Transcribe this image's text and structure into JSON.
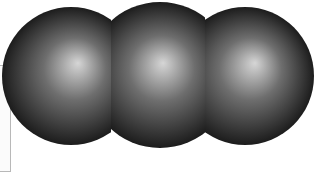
{
  "scene": {
    "description": "three shaded spheres in a row",
    "background": "#ffffff",
    "sphere_colors": {
      "highlight": "#d6d6d6",
      "mid": "#6e6e6e",
      "shadow": "#1c1c1c"
    },
    "spheres": [
      {
        "name": "left",
        "cx": 71,
        "cy": 76,
        "r": 69,
        "hx": 78,
        "hy": 63,
        "clip_x_min": 0,
        "clip_x_max": 111
      },
      {
        "name": "middle",
        "cx": 160,
        "cy": 75,
        "r": 73,
        "hx": 163,
        "hy": 63,
        "clip_x_min": 111,
        "clip_x_max": 205
      },
      {
        "name": "right",
        "cx": 245,
        "cy": 76,
        "r": 69,
        "hx": 255,
        "hy": 63,
        "clip_x_min": 205,
        "clip_x_max": 329
      }
    ],
    "frame_outline_color": "#b8b8b8"
  }
}
